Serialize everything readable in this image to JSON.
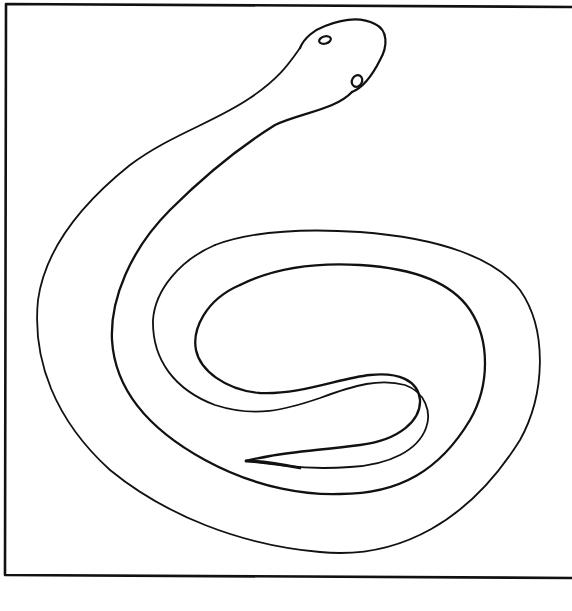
{
  "image": {
    "subject": "snake line drawing",
    "background_color": "#ffffff",
    "stroke_color": "#111111",
    "frame": {
      "x": 5,
      "y": 4,
      "width": 580,
      "height": 571,
      "stroke_width": 2.5
    }
  }
}
